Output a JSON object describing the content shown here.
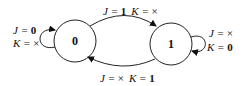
{
  "diagram": {
    "states": [
      {
        "id": "s0",
        "label": "0"
      },
      {
        "id": "s1",
        "label": "1"
      }
    ],
    "transitions": {
      "s0_to_s1": {
        "j": "J = ",
        "jv": "1",
        "k": "K = ",
        "kv": "×"
      },
      "s1_to_s0": {
        "j": "J = ",
        "jv": "×",
        "k": "K = ",
        "kv": "1"
      },
      "s0_self": {
        "j": "J = ",
        "jv": "0",
        "k": "K = ",
        "kv": "×"
      },
      "s1_self": {
        "j": "J = ",
        "jv": "×",
        "k": "K = ",
        "kv": "0"
      }
    }
  }
}
